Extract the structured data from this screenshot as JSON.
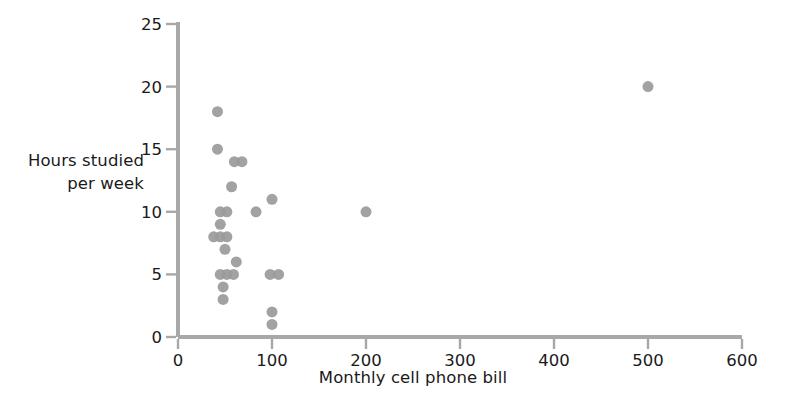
{
  "chart_data": {
    "type": "scatter",
    "title": "",
    "xlabel": "Monthly cell phone bill",
    "ylabel": "Hours studied per week",
    "ylabel_line1": "Hours studied",
    "ylabel_line2": "per week",
    "xlim": [
      0,
      600
    ],
    "ylim": [
      0,
      25
    ],
    "xticks": [
      0,
      100,
      200,
      300,
      400,
      500,
      600
    ],
    "yticks": [
      0,
      5,
      10,
      15,
      20,
      25
    ],
    "xticklabels": [
      "0",
      "100",
      "200",
      "300",
      "400",
      "500",
      "600"
    ],
    "yticklabels": [
      "0",
      "5",
      "10",
      "15",
      "20",
      "25"
    ],
    "grid": false,
    "legend": null,
    "marker": {
      "shape": "circle",
      "color": "#9a9a9a",
      "size": 11
    },
    "n_points": 34,
    "points": [
      {
        "x": 42,
        "y": 18
      },
      {
        "x": 42,
        "y": 15
      },
      {
        "x": 60,
        "y": 14
      },
      {
        "x": 68,
        "y": 14
      },
      {
        "x": 57,
        "y": 12
      },
      {
        "x": 100,
        "y": 11
      },
      {
        "x": 83,
        "y": 10
      },
      {
        "x": 45,
        "y": 10
      },
      {
        "x": 52,
        "y": 10
      },
      {
        "x": 45,
        "y": 9
      },
      {
        "x": 38,
        "y": 8
      },
      {
        "x": 45,
        "y": 8
      },
      {
        "x": 52,
        "y": 8
      },
      {
        "x": 50,
        "y": 7
      },
      {
        "x": 62,
        "y": 6
      },
      {
        "x": 45,
        "y": 5
      },
      {
        "x": 52,
        "y": 5
      },
      {
        "x": 59,
        "y": 5
      },
      {
        "x": 98,
        "y": 5
      },
      {
        "x": 107,
        "y": 5
      },
      {
        "x": 48,
        "y": 4
      },
      {
        "x": 48,
        "y": 3
      },
      {
        "x": 100,
        "y": 2
      },
      {
        "x": 100,
        "y": 1
      },
      {
        "x": 200,
        "y": 10
      },
      {
        "x": 500,
        "y": 20
      }
    ]
  },
  "axes": {
    "x_axis_name": "x-axis",
    "y_axis_name": "y-axis"
  }
}
